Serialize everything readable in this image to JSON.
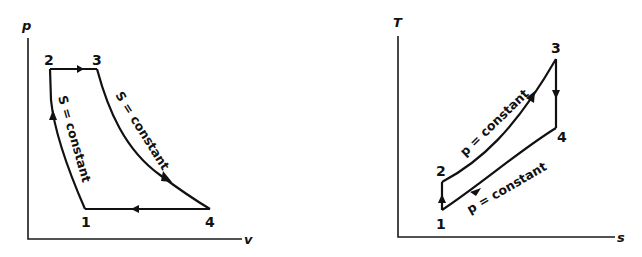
{
  "colors": {
    "ink": "#111111",
    "background": "#ffffff"
  },
  "pv_diagram": {
    "x_axis_label": "v",
    "y_axis_label": "p",
    "points": [
      {
        "label": "1"
      },
      {
        "label": "2"
      },
      {
        "label": "3"
      },
      {
        "label": "4"
      }
    ],
    "annotations": {
      "left_curve": "S = constant",
      "right_curve": "S = constant"
    }
  },
  "ts_diagram": {
    "x_axis_label": "s",
    "y_axis_label": "T",
    "points": [
      {
        "label": "1"
      },
      {
        "label": "2"
      },
      {
        "label": "3"
      },
      {
        "label": "4"
      }
    ],
    "annotations": {
      "upper_curve": "p = constant",
      "lower_curve": "p = constant"
    }
  }
}
